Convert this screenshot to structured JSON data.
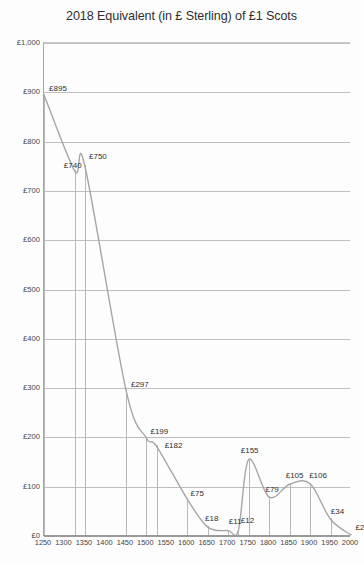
{
  "chart_data": {
    "type": "line",
    "title": "2018 Equivalent (in £ Sterling) of £1 Scots",
    "xlabel": "",
    "ylabel": "",
    "xlim": [
      1250,
      2000
    ],
    "ylim": [
      0,
      1000
    ],
    "grid": "horizontal",
    "legend": "none",
    "line_color": "#a6a6a6",
    "x_ticks": [
      "1250",
      "1300",
      "1350",
      "1400",
      "1450",
      "1500",
      "1550",
      "1600",
      "1650",
      "1700",
      "1750",
      "1800",
      "1850",
      "1900",
      "1950",
      "2000"
    ],
    "y_ticks": [
      "£0",
      "£100",
      "£200",
      "£300",
      "£400",
      "£500",
      "£600",
      "£700",
      "£800",
      "£900",
      "£1,000"
    ],
    "y_tick_values": [
      0,
      100,
      200,
      300,
      400,
      500,
      600,
      700,
      800,
      900,
      1000
    ],
    "x": [
      1250,
      1325,
      1350,
      1450,
      1500,
      1525,
      1600,
      1650,
      1700,
      1725,
      1750,
      1800,
      1850,
      1900,
      1950,
      2000
    ],
    "values": [
      895,
      740,
      750,
      297,
      199,
      182,
      75,
      18,
      11,
      12,
      155,
      79,
      105,
      106,
      34,
      2
    ],
    "point_labels": [
      "£895",
      "£740",
      "£750",
      "£297",
      "£199",
      "£182",
      "£75",
      "£18",
      "£11",
      "£12",
      "£155",
      "£79",
      "£105",
      "£106",
      "£34",
      "£2"
    ],
    "points": [
      {
        "x": 1250,
        "y": 895,
        "label": "£895"
      },
      {
        "x": 1325,
        "y": 740,
        "label": "£740"
      },
      {
        "x": 1350,
        "y": 750,
        "label": "£750"
      },
      {
        "x": 1450,
        "y": 297,
        "label": "£297"
      },
      {
        "x": 1500,
        "y": 199,
        "label": "£199"
      },
      {
        "x": 1525,
        "y": 182,
        "label": "£182"
      },
      {
        "x": 1600,
        "y": 75,
        "label": "£75"
      },
      {
        "x": 1650,
        "y": 18,
        "label": "£18"
      },
      {
        "x": 1700,
        "y": 11,
        "label": "£11"
      },
      {
        "x": 1725,
        "y": 12,
        "label": "£12"
      },
      {
        "x": 1750,
        "y": 155,
        "label": "£155"
      },
      {
        "x": 1800,
        "y": 79,
        "label": "£79"
      },
      {
        "x": 1850,
        "y": 105,
        "label": "£105"
      },
      {
        "x": 1900,
        "y": 106,
        "label": "£106"
      },
      {
        "x": 1950,
        "y": 34,
        "label": "£34"
      },
      {
        "x": 2000,
        "y": 2,
        "label": "£2"
      }
    ]
  }
}
